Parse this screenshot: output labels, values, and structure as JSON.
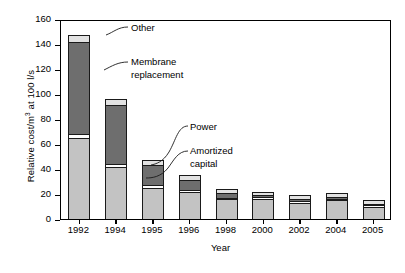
{
  "chart_data": {
    "type": "bar",
    "stacked": true,
    "title": "",
    "xlabel": "Year",
    "ylabel": "Relative cost/m3 at 100 l/s",
    "ylabel_display": "Relative cost/m³ at 100 l/s",
    "categories": [
      "1992",
      "1994",
      "1995",
      "1996",
      "1998",
      "2000",
      "2002",
      "2004",
      "2005"
    ],
    "ylim": [
      0,
      160
    ],
    "yticks": [
      0,
      20,
      40,
      60,
      80,
      100,
      120,
      140,
      160
    ],
    "grid": false,
    "legend": "annotations with leader lines",
    "series": [
      {
        "name": "Amortized capital",
        "color": "#c3c3c3",
        "values": [
          65,
          42,
          25,
          22,
          16,
          16,
          13,
          15,
          10
        ]
      },
      {
        "name": "Power",
        "color": "#ffffff",
        "values": [
          3,
          2,
          2,
          1.5,
          1,
          1.5,
          1.5,
          1,
          1
        ]
      },
      {
        "name": "Membrane replacement",
        "color": "#6e6e6e",
        "values": [
          74,
          47,
          16,
          8,
          4,
          1.5,
          1.5,
          2,
          1
        ]
      },
      {
        "name": "Other",
        "color": "#e2e2e2",
        "values": [
          5,
          5,
          4,
          4,
          3,
          3,
          3.5,
          3,
          3
        ]
      }
    ],
    "totals": [
      147,
      96,
      47,
      35.5,
      24,
      22,
      19,
      21,
      15
    ],
    "annotations": [
      {
        "name": "other",
        "text": "Other"
      },
      {
        "name": "membrane-replacement",
        "text": "Membrane\nreplacement"
      },
      {
        "name": "power",
        "text": "Power"
      },
      {
        "name": "amortized-capital",
        "text": "Amortized\ncapital"
      }
    ]
  },
  "axis": {
    "y_title_pre": "Relative cost/m",
    "y_title_sup": "3",
    "y_title_post": " at 100 l/s",
    "x_title": "Year"
  }
}
